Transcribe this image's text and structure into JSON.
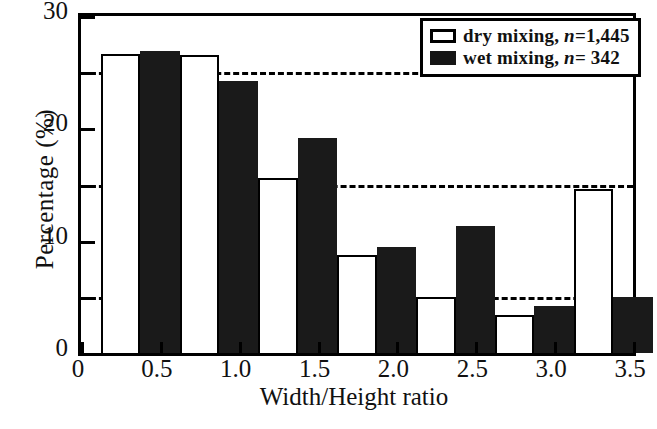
{
  "chart_data": {
    "type": "bar",
    "title": "",
    "xlabel": "Width/Height ratio",
    "ylabel": "Percentage (%)",
    "xlim": [
      0,
      3.5
    ],
    "ylim": [
      0,
      30
    ],
    "xticks": [
      "0",
      "0.5",
      "1.0",
      "1.5",
      "2.0",
      "2.5",
      "3.0",
      "3.5"
    ],
    "xtick_values": [
      0,
      0.5,
      1.0,
      1.5,
      2.0,
      2.5,
      3.0,
      3.5
    ],
    "yticks": [
      "0",
      "10",
      "20",
      "30"
    ],
    "ytick_values": [
      0,
      10,
      20,
      30
    ],
    "gridlines_y": [
      5,
      15,
      25
    ],
    "grid": "horizontal-dashed",
    "legend_position": "top-right",
    "bin_edges": [
      0.125,
      0.625,
      1.125,
      1.625,
      2.125,
      2.625,
      3.125
    ],
    "bin_centers": [
      0.25,
      0.75,
      1.25,
      1.75,
      2.25,
      2.75,
      3.25
    ],
    "bar_width": 0.25,
    "series": [
      {
        "name": "dry mixing",
        "n": "1,445",
        "fill": "white",
        "values": [
          26.6,
          26.5,
          15.6,
          8.7,
          5.0,
          3.4,
          14.6
        ]
      },
      {
        "name": "wet mixing",
        "n": "342",
        "fill": "black",
        "values": [
          26.9,
          24.2,
          19.1,
          9.4,
          11.3,
          4.2,
          5.0
        ]
      }
    ]
  },
  "legend": {
    "rows": [
      {
        "prefix": "dry mixing, ",
        "symbol": "n",
        "suffix": "=1,445",
        "swatch": "dry"
      },
      {
        "prefix": "wet mixing, ",
        "symbol": "n",
        "suffix": "=  342",
        "swatch": "wet"
      }
    ]
  },
  "colors": {
    "axis": "#000000",
    "dry_bar_fill": "#ffffff",
    "dry_bar_edge": "#000000",
    "wet_bar_fill": "#1a1a1a",
    "background": "#ffffff"
  }
}
